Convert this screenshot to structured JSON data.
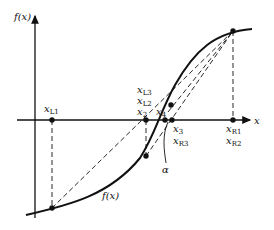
{
  "diagram": {
    "axes": {
      "y_label": "f(x)",
      "x_label": "x"
    },
    "curve_label": "f(x)",
    "root_label": "α",
    "points": {
      "xL1": {
        "base": "x",
        "sub": "L1"
      },
      "xL3": {
        "base": "x",
        "sub": "L3"
      },
      "xL2": {
        "base": "x",
        "sub": "L2"
      },
      "x2": {
        "base": "x",
        "sub": "2"
      },
      "x4": {
        "base": "x",
        "sub": "4"
      },
      "x3": {
        "base": "x",
        "sub": "3"
      },
      "xR3": {
        "base": "x",
        "sub": "R3"
      },
      "xR1": {
        "base": "x",
        "sub": "R1"
      },
      "xR2": {
        "base": "x",
        "sub": "R2"
      }
    },
    "colors": {
      "ink": "#111111",
      "background": "#ffffff"
    }
  }
}
